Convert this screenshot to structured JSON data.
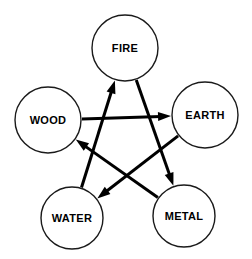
{
  "diagram": {
    "type": "pentagram-cycle",
    "background_color": "#ffffff",
    "stroke_color": "#000000",
    "node_fill": "#ffffff",
    "nodes": [
      {
        "id": "fire",
        "label": "FIRE",
        "cx": 125,
        "cy": 48,
        "r": 33
      },
      {
        "id": "wood",
        "label": "WOOD",
        "cx": 48,
        "cy": 120,
        "r": 33
      },
      {
        "id": "earth",
        "label": "EARTH",
        "cx": 205,
        "cy": 115,
        "r": 33
      },
      {
        "id": "water",
        "label": "WATER",
        "cx": 72,
        "cy": 218,
        "r": 31
      },
      {
        "id": "metal",
        "label": "METAL",
        "cx": 184,
        "cy": 216,
        "r": 31
      }
    ],
    "edges": [
      {
        "id": "wood-earth",
        "from": "wood",
        "to": "earth",
        "from_label": "WOOD",
        "to_label": "EARTH"
      },
      {
        "id": "earth-water",
        "from": "earth",
        "to": "water",
        "from_label": "EARTH",
        "to_label": "WATER"
      },
      {
        "id": "water-fire",
        "from": "water",
        "to": "fire",
        "from_label": "WATER",
        "to_label": "FIRE"
      },
      {
        "id": "fire-metal",
        "from": "fire",
        "to": "metal",
        "from_label": "FIRE",
        "to_label": "METAL"
      },
      {
        "id": "metal-wood",
        "from": "metal",
        "to": "wood",
        "from_label": "METAL",
        "to_label": "WOOD"
      }
    ]
  }
}
